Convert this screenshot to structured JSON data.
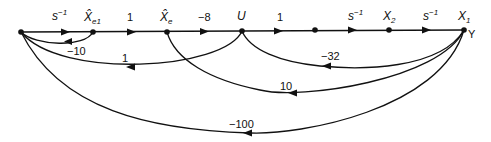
{
  "diagram": {
    "type": "signal-flow-graph",
    "nodes": [
      {
        "id": "n0",
        "label": "",
        "x": 21,
        "y": 32
      },
      {
        "id": "xe1",
        "label_main": "X̂",
        "label_sub": "e1",
        "x": 93,
        "y": 32
      },
      {
        "id": "xe",
        "label_main": "X̂",
        "label_sub": "e",
        "x": 167,
        "y": 32
      },
      {
        "id": "u",
        "label_main": "U",
        "label_sub": "",
        "x": 242,
        "y": 31
      },
      {
        "id": "n4",
        "label": "",
        "x": 315,
        "y": 30
      },
      {
        "id": "x2",
        "label_main": "X",
        "label_sub": "2",
        "x": 389,
        "y": 30
      },
      {
        "id": "x1",
        "label_main": "X",
        "label_sub": "1",
        "x": 464,
        "y": 30,
        "output_label": "Y"
      }
    ],
    "forward_edges": [
      {
        "from": "n0",
        "to": "xe1",
        "gain_main": "s",
        "gain_sup": "−1"
      },
      {
        "from": "xe1",
        "to": "xe",
        "gain_main": "1",
        "gain_sup": ""
      },
      {
        "from": "xe",
        "to": "u",
        "gain_main": "−8",
        "gain_sup": ""
      },
      {
        "from": "u",
        "to": "n4",
        "gain_main": "1",
        "gain_sup": ""
      },
      {
        "from": "n4",
        "to": "x2",
        "gain_main": "s",
        "gain_sup": "−1"
      },
      {
        "from": "x2",
        "to": "x1",
        "gain_main": "s",
        "gain_sup": "−1"
      }
    ],
    "feedback_edges": [
      {
        "from": "xe1",
        "to": "n0",
        "gain": "−10"
      },
      {
        "from": "u",
        "to": "n0",
        "gain": "1"
      },
      {
        "from": "x1",
        "to": "u",
        "gain": "−32"
      },
      {
        "from": "x1",
        "to": "xe",
        "gain": "10"
      },
      {
        "from": "x1",
        "to": "n0",
        "gain": "−100"
      }
    ]
  }
}
